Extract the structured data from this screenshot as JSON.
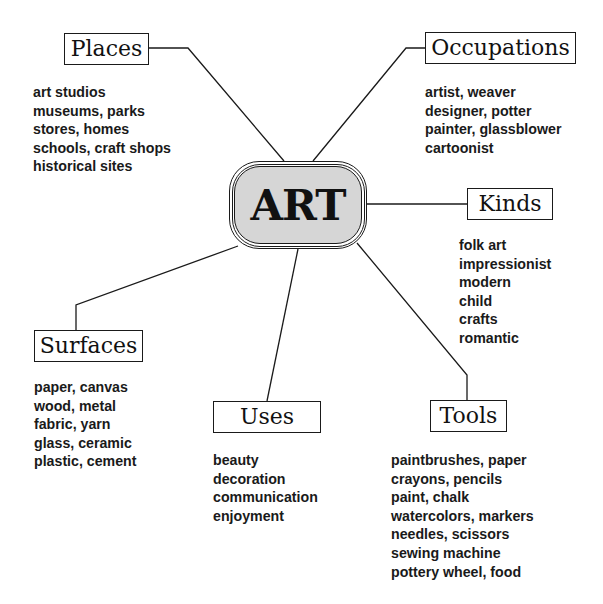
{
  "center": {
    "label": "ART",
    "fill": "#d6d6d6"
  },
  "categories": [
    {
      "id": "places",
      "label": "Places",
      "items": [
        "art studios",
        "museums, parks",
        "stores, homes",
        "schools, craft shops",
        "historical sites"
      ]
    },
    {
      "id": "occupations",
      "label": "Occupations",
      "items": [
        "artist, weaver",
        "designer, potter",
        "painter, glassblower",
        "cartoonist"
      ]
    },
    {
      "id": "kinds",
      "label": "Kinds",
      "items": [
        "folk art",
        "impressionist",
        "modern",
        "child",
        "crafts",
        "romantic"
      ]
    },
    {
      "id": "surfaces",
      "label": "Surfaces",
      "items": [
        "paper, canvas",
        "wood, metal",
        "fabric, yarn",
        "glass, ceramic",
        "plastic, cement"
      ]
    },
    {
      "id": "uses",
      "label": "Uses",
      "items": [
        "beauty",
        "decoration",
        "communication",
        "enjoyment"
      ]
    },
    {
      "id": "tools",
      "label": "Tools",
      "items": [
        "paintbrushes, paper",
        "crayons, pencils",
        "paint, chalk",
        "watercolors, markers",
        "needles, scissors",
        "sewing machine",
        "pottery wheel, food"
      ]
    }
  ]
}
